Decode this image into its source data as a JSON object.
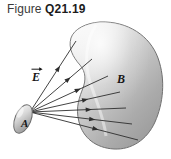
{
  "figure": {
    "caption_word": "Figure",
    "caption_number": "Q21.19",
    "background_color": "#ffffff"
  },
  "labels": {
    "field_label": "E",
    "field_label_kind": "vector-arrow-over-E",
    "source_label": "A",
    "target_label": "B"
  },
  "objects": {
    "source": {
      "name": "A",
      "shape": "small-tilted-ellipse",
      "fill_light": "#f0f0f0",
      "fill_dark": "#9a9a9a",
      "outline": "#6d6d6d",
      "cx": 23,
      "cy": 119,
      "rx": 8,
      "ry": 15,
      "rotation_deg": 22
    },
    "target": {
      "name": "B",
      "shape": "kidney-bean-blob",
      "fill_light": "#f4f4f4",
      "fill_mid": "#c9c9c9",
      "fill_dark": "#9b9b9b",
      "outline": "#6f6f6f",
      "bounds": [
        68,
        22,
        162,
        150
      ]
    }
  },
  "field_lines": {
    "count": 7,
    "color": "#2e2e2e",
    "origin": [
      30,
      112
    ],
    "arrow_fraction": 0.58,
    "endpoints": [
      [
        76,
        41
      ],
      [
        92,
        59
      ],
      [
        108,
        76
      ],
      [
        120,
        92
      ],
      [
        126,
        108
      ],
      [
        132,
        124
      ],
      [
        138,
        140
      ]
    ]
  }
}
